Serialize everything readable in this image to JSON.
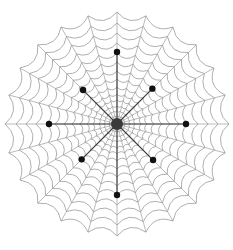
{
  "diagram": {
    "type": "spider-web",
    "width": 233,
    "height": 250,
    "center": {
      "x": 117,
      "y": 124
    },
    "outer_radius": 112,
    "spoke_count": 24,
    "ring_radii": [
      8,
      13,
      18,
      24,
      30,
      37,
      45,
      53,
      62,
      71,
      81,
      91,
      101,
      112
    ],
    "ring_sag": 0.06,
    "colors": {
      "background": "#ffffff",
      "web_line": "#9a9a9a",
      "strong_spoke": "#3a3a3a",
      "node": "#111111",
      "hub": "#3a3a3a"
    },
    "hub": {
      "radius": 6
    },
    "nodes": [
      {
        "name": "node-north",
        "angle_deg": -90,
        "radius": 72
      },
      {
        "name": "node-northeast",
        "angle_deg": -45,
        "radius": 50
      },
      {
        "name": "node-east",
        "angle_deg": 0,
        "radius": 69
      },
      {
        "name": "node-southeast",
        "angle_deg": 45,
        "radius": 51
      },
      {
        "name": "node-south",
        "angle_deg": 90,
        "radius": 71
      },
      {
        "name": "node-southwest",
        "angle_deg": 135,
        "radius": 50
      },
      {
        "name": "node-west",
        "angle_deg": 180,
        "radius": 68
      },
      {
        "name": "node-northwest",
        "angle_deg": 225,
        "radius": 48
      }
    ],
    "node_radius": 3.2
  }
}
